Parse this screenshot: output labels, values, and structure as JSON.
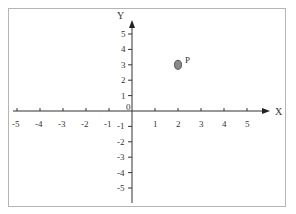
{
  "diagram": {
    "type": "coordinate-plane",
    "x_axis_label": "X",
    "y_axis_label": "Y",
    "origin_label": "0",
    "x_ticks": [
      -5,
      -4,
      -3,
      -2,
      -1,
      1,
      2,
      3,
      4,
      5
    ],
    "y_ticks": [
      5,
      4,
      3,
      2,
      1,
      -1,
      -2,
      -3,
      -4,
      -5
    ],
    "point": {
      "label": "P",
      "x": 2,
      "y": 3,
      "color": "#8a8a8a"
    }
  }
}
